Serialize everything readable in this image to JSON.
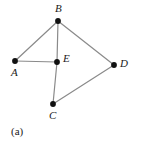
{
  "figure": {
    "caption": "(a)",
    "type": "undirected-graph-diagram",
    "background_color": "#ffffff",
    "edge_color": "#8a8a8a",
    "vertex_color": "#111111",
    "label_color": "#1a1a1a"
  },
  "graph": {
    "vertices": [
      {
        "id": "A",
        "label": "A",
        "x": 15,
        "y": 61,
        "label_x": 11,
        "label_y": 67
      },
      {
        "id": "B",
        "label": "B",
        "x": 58,
        "y": 21,
        "label_x": 55,
        "label_y": 3
      },
      {
        "id": "C",
        "label": "C",
        "x": 53,
        "y": 104,
        "label_x": 49,
        "label_y": 110
      },
      {
        "id": "D",
        "label": "D",
        "x": 114,
        "y": 65,
        "label_x": 120,
        "label_y": 58
      },
      {
        "id": "E",
        "label": "E",
        "x": 57,
        "y": 62,
        "label_x": 63,
        "label_y": 53
      }
    ],
    "edges": [
      {
        "from": "A",
        "to": "B"
      },
      {
        "from": "A",
        "to": "E"
      },
      {
        "from": "B",
        "to": "E"
      },
      {
        "from": "B",
        "to": "D"
      },
      {
        "from": "E",
        "to": "C"
      },
      {
        "from": "C",
        "to": "D"
      }
    ],
    "vertex_radius": 2.9,
    "edge_width": 1.2
  }
}
